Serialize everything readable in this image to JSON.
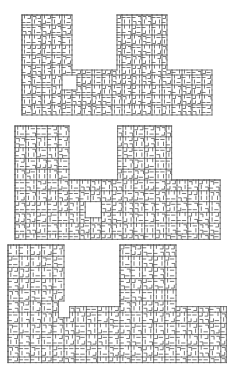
{
  "diagram": {
    "line_color": "#555555",
    "background": "#ffffff",
    "figures": [
      {
        "id": "figure-1",
        "top": 15,
        "cell": 10.0,
        "origin_x": 22,
        "cols": 19,
        "rows": 10,
        "towers": [
          {
            "col_start": 0,
            "col_end": 5,
            "row_start": 0
          },
          {
            "col_start": 9.6,
            "col_end": 14.4,
            "row_start": 0
          }
        ],
        "band_row_start": 5.3,
        "hole": {
          "col": 4,
          "row": 6,
          "w": 1.3,
          "h": 1.5
        },
        "seed": 7
      },
      {
        "id": "figure-2",
        "top": 126,
        "cell": 10.8,
        "origin_x": 15,
        "cols": 19,
        "rows": 10.4,
        "towers": [
          {
            "col_start": 0,
            "col_end": 5,
            "row_start": 0
          },
          {
            "col_start": 9.5,
            "col_end": 14.5,
            "row_start": 0
          }
        ],
        "band_row_start": 5.1,
        "hole": {
          "col": 6.6,
          "row": 7.2,
          "w": 1.2,
          "h": 1.5
        },
        "seed": 21
      },
      {
        "id": "figure-3",
        "top": 245,
        "cell": 11.2,
        "origin_x": 8,
        "cols": 19.6,
        "rows": 10.4,
        "towers": [
          {
            "col_start": 0,
            "col_end": 5.1,
            "row_start": 0
          },
          {
            "col_start": 9.8,
            "col_end": 14.8,
            "row_start": 0
          }
        ],
        "band_row_start": 5.3,
        "hole": {
          "col": 4.6,
          "row": 5.2,
          "w": 1.1,
          "h": 1.4
        },
        "seed": 42
      }
    ]
  }
}
